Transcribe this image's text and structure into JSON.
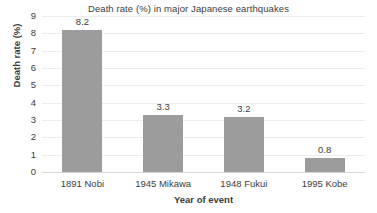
{
  "chart_data": {
    "type": "bar",
    "title": "Death rate (%) in major Japanese earthquakes",
    "xlabel": "Year of event",
    "ylabel": "Death rate (%)",
    "categories": [
      "1891 Nobi",
      "1945 Mikawa",
      "1948 Fukui",
      "1995 Kobe"
    ],
    "values": [
      8.2,
      3.3,
      3.2,
      0.8
    ],
    "value_labels": [
      "8.2",
      "3.3",
      "3.2",
      "0.8"
    ],
    "ylim": [
      0,
      9
    ],
    "ytick_labels": [
      "0",
      "1",
      "2",
      "3",
      "4",
      "5",
      "6",
      "7",
      "8",
      "9"
    ],
    "ytick_values": [
      0,
      1,
      2,
      3,
      4,
      5,
      6,
      7,
      8,
      9
    ],
    "grid": true,
    "legend": false,
    "series_name": "Death rate (%)",
    "bar_color": "#9c9c9c",
    "gridline_color": "#ececec",
    "axis_color": "#d6d6d6",
    "text_color": "#3c3c3c",
    "background_color": "#ffffff"
  }
}
